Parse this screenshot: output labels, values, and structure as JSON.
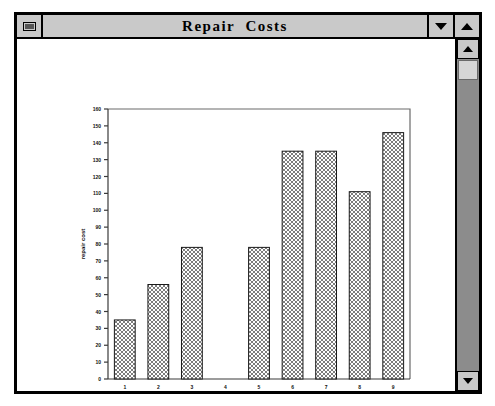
{
  "window": {
    "title": "Repair  Costs",
    "system_menu_icon": "system-box-icon",
    "dropdown_icon": "chevron-down-icon",
    "maximize_icon": "chevron-up-icon"
  },
  "scrollbar": {
    "up_arrow_icon": "scroll-up-arrow-icon",
    "down_arrow_icon": "scroll-down-arrow-icon",
    "thumb_label": "scrollbar-thumb"
  },
  "chart_data": {
    "type": "bar",
    "title": "",
    "xlabel": "car brand",
    "ylabel": "repair cost",
    "categories": [
      "1",
      "2",
      "3",
      "4",
      "5",
      "6",
      "7",
      "8",
      "9"
    ],
    "values": [
      35,
      56,
      78,
      0,
      78,
      135,
      135,
      111,
      146
    ],
    "ylim": [
      0,
      160
    ],
    "yticks": [
      0,
      10,
      20,
      30,
      40,
      50,
      60,
      70,
      80,
      90,
      100,
      110,
      120,
      130,
      140,
      150,
      160
    ],
    "ytick_labels": [
      "0",
      "10",
      "20",
      "30",
      "40",
      "50",
      "60",
      "70",
      "80",
      "90",
      "100",
      "110",
      "120",
      "130",
      "140",
      "150",
      "160"
    ],
    "grid": false,
    "legend": null,
    "bar_fill": "#9a9a9a",
    "bar_edge": "#1a1a1a",
    "bar_pattern": "checkerboard-hatch"
  }
}
